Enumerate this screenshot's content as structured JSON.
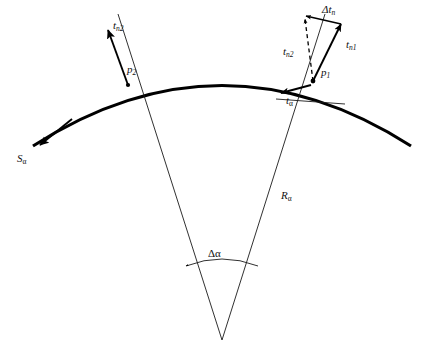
{
  "figure": {
    "background_color": "#ffffff",
    "stroke_color": "#000000"
  },
  "labels": {
    "point_1": {
      "base": "p",
      "sub": "1"
    },
    "point_2": {
      "base": "p",
      "sub": "2"
    },
    "normal_1": {
      "base": "t",
      "sub": "n1"
    },
    "normal_2_at_p1": {
      "base": "t",
      "sub": "n2"
    },
    "normal_2_at_p2": {
      "base": "t",
      "sub": "n2"
    },
    "delta_normal": {
      "base": "Δt",
      "sub": "n"
    },
    "tangent_alpha": {
      "base": "t",
      "sub": "α"
    },
    "arc_length": {
      "base": "S",
      "sub": "α"
    },
    "radius": {
      "base": "R",
      "sub": "α"
    },
    "delta_angle": {
      "base": "Δα",
      "sub": ""
    }
  },
  "elements": {
    "main_arc_name": "curved surface arc",
    "radius_line_1_name": "radius to p1",
    "radius_line_2_name": "radius to p2",
    "angle_arc_name": "delta alpha angle arc",
    "vector_triangle_name": "normal vector difference triangle"
  }
}
